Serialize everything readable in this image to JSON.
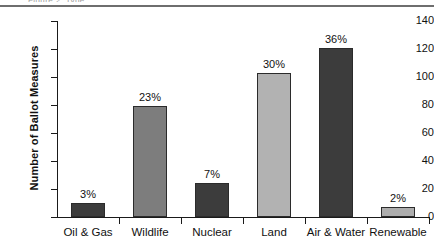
{
  "header": {
    "clipped_text": "Figure 2. Type",
    "rule_color": "#6e6e6e"
  },
  "chart_data": {
    "type": "bar",
    "title": "",
    "subtitle": "",
    "xlabel": "",
    "ylabel": "Number of Ballot Measures",
    "ylim": [
      0,
      140
    ],
    "grid": false,
    "legend": "none",
    "categories": [
      "Oil & Gas",
      "Wildlife",
      "Nuclear",
      "Land",
      "Air & Water",
      "Renewable"
    ],
    "values": [
      10,
      79,
      24,
      103,
      121,
      7
    ],
    "data_labels": [
      "3%",
      "23%",
      "7%",
      "30%",
      "36%",
      "2%"
    ],
    "bar_colors": [
      "#3c3c3c",
      "#7d7d7d",
      "#3c3c3c",
      "#b2b2b2",
      "#3c3c3c",
      "#adadad"
    ],
    "y_ticks": [
      0,
      20,
      40,
      60,
      80,
      100,
      120,
      140
    ],
    "y_tick_labels": [
      "0",
      "20",
      "40",
      "60",
      "80",
      "100",
      "120",
      "140"
    ],
    "axis_color": "#1a1a1a",
    "text_color": "#111111"
  }
}
